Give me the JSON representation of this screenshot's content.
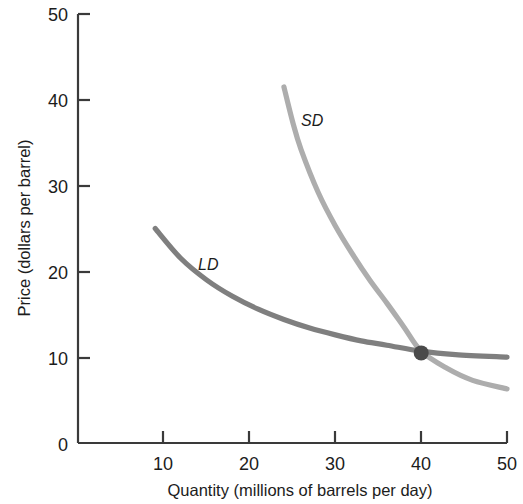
{
  "chart_data": {
    "type": "line",
    "title": "",
    "xlabel": "Quantity (millions of barrels per day)",
    "ylabel": "Price (dollars per barrel)",
    "xlim": [
      0,
      50
    ],
    "ylim": [
      0,
      50
    ],
    "xticks": [
      "10",
      "20",
      "30",
      "40",
      "50"
    ],
    "xtick_values": [
      10,
      20,
      30,
      40,
      50
    ],
    "yticks": [
      "0",
      "10",
      "20",
      "30",
      "40",
      "50"
    ],
    "ytick_values": [
      0,
      10,
      20,
      30,
      40,
      50
    ],
    "grid": false,
    "legend": "inline-curve-labels",
    "series": [
      {
        "name": "LD",
        "label": "LD",
        "description": "long-run demand curve",
        "color": "#7f7f7f",
        "x": [
          9,
          12,
          15,
          18,
          21,
          24,
          27,
          30,
          33,
          36,
          40,
          44,
          50
        ],
        "y": [
          25.0,
          21.5,
          19.0,
          17.1,
          15.6,
          14.4,
          13.4,
          12.6,
          11.9,
          11.4,
          10.7,
          10.3,
          10.0
        ]
      },
      {
        "name": "SD",
        "label": "SD",
        "description": "short-run demand curve",
        "color": "#adadad",
        "x": [
          24,
          25,
          26,
          28,
          30,
          32,
          34,
          36,
          38,
          40,
          43,
          46,
          50
        ],
        "y": [
          41.5,
          37.5,
          34.2,
          29.2,
          25.3,
          22.0,
          19.0,
          16.3,
          13.5,
          10.7,
          8.7,
          7.3,
          6.3
        ]
      }
    ],
    "annotations": [
      {
        "name": "equilibrium-point",
        "type": "point-marker",
        "x": 40,
        "y": 10.5,
        "color": "#4a4a4a",
        "label": ""
      }
    ]
  },
  "labels": {
    "y_axis": "Price (dollars per barrel)",
    "x_axis": "Quantity (millions of barrels per day)",
    "curve_ld": "LD",
    "curve_sd": "SD"
  },
  "ticks": {
    "y": [
      "50",
      "40",
      "30",
      "20",
      "10",
      "0"
    ],
    "x": [
      "10",
      "20",
      "30",
      "40",
      "50"
    ]
  },
  "colors": {
    "ld_curve": "#7f7f7f",
    "sd_curve": "#adadad",
    "axis": "#3a3a3a",
    "point": "#4a4a4a",
    "background": "#ffffff",
    "text": "#1c1c1c"
  }
}
